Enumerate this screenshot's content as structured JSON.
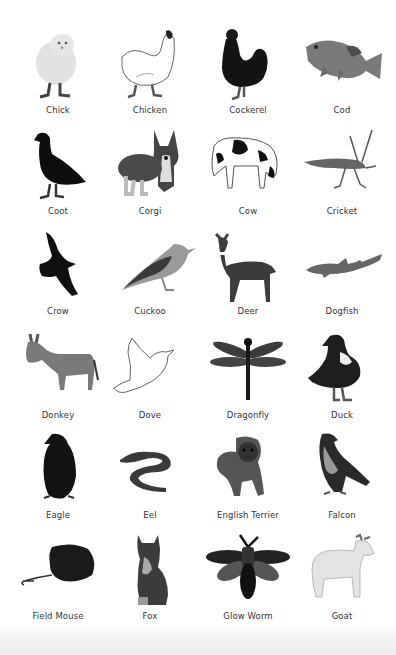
{
  "page": {
    "background": "#ffffff",
    "label_color": "#333333"
  },
  "animals": [
    {
      "label": "Chick",
      "icon": "chick-icon"
    },
    {
      "label": "Chicken",
      "icon": "chicken-icon"
    },
    {
      "label": "Cockerel",
      "icon": "cockerel-icon"
    },
    {
      "label": "Cod",
      "icon": "cod-icon"
    },
    {
      "label": "Coot",
      "icon": "coot-icon"
    },
    {
      "label": "Corgi",
      "icon": "corgi-icon"
    },
    {
      "label": "Cow",
      "icon": "cow-icon"
    },
    {
      "label": "Cricket",
      "icon": "cricket-icon"
    },
    {
      "label": "Crow",
      "icon": "crow-icon"
    },
    {
      "label": "Cuckoo",
      "icon": "cuckoo-icon"
    },
    {
      "label": "Deer",
      "icon": "deer-icon"
    },
    {
      "label": "Dogfish",
      "icon": "dogfish-icon"
    },
    {
      "label": "Donkey",
      "icon": "donkey-icon"
    },
    {
      "label": "Dove",
      "icon": "dove-icon"
    },
    {
      "label": "Dragonfly",
      "icon": "dragonfly-icon"
    },
    {
      "label": "Duck",
      "icon": "duck-icon"
    },
    {
      "label": "Eagle",
      "icon": "eagle-icon"
    },
    {
      "label": "Eel",
      "icon": "eel-icon"
    },
    {
      "label": "English Terrier",
      "icon": "english-terrier-icon"
    },
    {
      "label": "Falcon",
      "icon": "falcon-icon"
    },
    {
      "label": "Field Mouse",
      "icon": "field-mouse-icon"
    },
    {
      "label": "Fox",
      "icon": "fox-icon"
    },
    {
      "label": "Glow Worm",
      "icon": "glow-worm-icon"
    },
    {
      "label": "Goat",
      "icon": "goat-icon"
    }
  ]
}
